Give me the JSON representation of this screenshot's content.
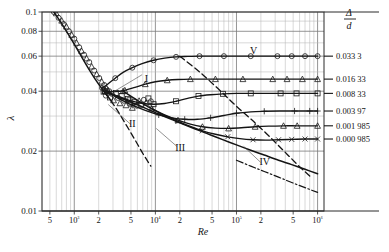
{
  "chart_data": {
    "type": "line",
    "title": "",
    "xlabel": "Re",
    "ylabel": "λ",
    "xscale": "log",
    "yscale": "log",
    "xlim": [
      400,
      1200000
    ],
    "ylim": [
      0.01,
      0.1
    ],
    "grid": true,
    "legend_position": "right",
    "legend_title_num": "Δ",
    "legend_title_den": "d",
    "x_ticks": [
      {
        "value": 500,
        "label": "5"
      },
      {
        "value": 1000,
        "label": "10³"
      },
      {
        "value": 2000,
        "label": "2"
      },
      {
        "value": 5000,
        "label": "5"
      },
      {
        "value": 10000,
        "label": "10⁴"
      },
      {
        "value": 20000,
        "label": "2"
      },
      {
        "value": 50000,
        "label": "5"
      },
      {
        "value": 100000,
        "label": "10⁵"
      },
      {
        "value": 200000,
        "label": "2"
      },
      {
        "value": 500000,
        "label": "5"
      },
      {
        "value": 1000000,
        "label": "10⁶"
      }
    ],
    "y_ticks": [
      {
        "value": 0.01,
        "label": "0.01"
      },
      {
        "value": 0.02,
        "label": "0.02"
      },
      {
        "value": 0.04,
        "label": "0.04"
      },
      {
        "value": 0.06,
        "label": "0.06"
      },
      {
        "value": 0.08,
        "label": "0.08"
      },
      {
        "value": 0.1,
        "label": "0.1"
      }
    ],
    "series": [
      {
        "name": "0.033 3",
        "legend_label": "0.033 3",
        "marker": "circle",
        "points": [
          [
            2200,
            0.0415
          ],
          [
            2600,
            0.0435
          ],
          [
            3200,
            0.0465
          ],
          [
            4000,
            0.0497
          ],
          [
            5200,
            0.0525
          ],
          [
            7000,
            0.0552
          ],
          [
            9500,
            0.0572
          ],
          [
            13000,
            0.0586
          ],
          [
            18000,
            0.0595
          ],
          [
            25000,
            0.0598
          ],
          [
            35000,
            0.06
          ],
          [
            50000,
            0.06
          ],
          [
            70000,
            0.06
          ],
          [
            100000,
            0.06
          ],
          [
            150000,
            0.06
          ],
          [
            220000,
            0.06
          ],
          [
            320000,
            0.06
          ],
          [
            480000,
            0.06
          ],
          [
            700000,
            0.06
          ],
          [
            1000000,
            0.06
          ]
        ]
      },
      {
        "name": "0.016 33",
        "legend_label": "0.016 33",
        "marker": "triangle",
        "points": [
          [
            2400,
            0.04
          ],
          [
            3200,
            0.0398
          ],
          [
            4200,
            0.0404
          ],
          [
            5600,
            0.0418
          ],
          [
            7500,
            0.0434
          ],
          [
            10000,
            0.0446
          ],
          [
            14000,
            0.0454
          ],
          [
            19000,
            0.0458
          ],
          [
            27000,
            0.046
          ],
          [
            38000,
            0.046
          ],
          [
            55000,
            0.046
          ],
          [
            80000,
            0.046
          ],
          [
            120000,
            0.046
          ],
          [
            180000,
            0.046
          ],
          [
            280000,
            0.046
          ],
          [
            420000,
            0.046
          ],
          [
            650000,
            0.046
          ],
          [
            1000000,
            0.046
          ]
        ]
      },
      {
        "name": "0.008 33",
        "legend_label": "0.008 33",
        "marker": "square",
        "points": [
          [
            2400,
            0.04
          ],
          [
            3400,
            0.0378
          ],
          [
            4800,
            0.036
          ],
          [
            6800,
            0.0348
          ],
          [
            9500,
            0.0344
          ],
          [
            13000,
            0.0347
          ],
          [
            18000,
            0.0356
          ],
          [
            25000,
            0.0368
          ],
          [
            34000,
            0.0378
          ],
          [
            48000,
            0.0384
          ],
          [
            68000,
            0.0388
          ],
          [
            100000,
            0.039
          ],
          [
            150000,
            0.039
          ],
          [
            230000,
            0.039
          ],
          [
            350000,
            0.039
          ],
          [
            550000,
            0.039
          ],
          [
            1000000,
            0.039
          ]
        ]
      },
      {
        "name": "0.003 97",
        "legend_label": "0.003 97",
        "marker": "plus",
        "points": [
          [
            2400,
            0.04
          ],
          [
            3600,
            0.0366
          ],
          [
            5200,
            0.034
          ],
          [
            7500,
            0.032
          ],
          [
            11000,
            0.0304
          ],
          [
            16000,
            0.0294
          ],
          [
            23000,
            0.0289
          ],
          [
            33000,
            0.0289
          ],
          [
            48000,
            0.0294
          ],
          [
            70000,
            0.0302
          ],
          [
            100000,
            0.031
          ],
          [
            150000,
            0.0315
          ],
          [
            220000,
            0.0317
          ],
          [
            340000,
            0.0318
          ],
          [
            520000,
            0.0318
          ],
          [
            800000,
            0.0318
          ],
          [
            1000000,
            0.0318
          ]
        ]
      },
      {
        "name": "0.001 985",
        "legend_label": "0.001 985",
        "marker": "triangle",
        "points": [
          [
            4000,
            0.04
          ],
          [
            6000,
            0.036
          ],
          [
            9000,
            0.0327
          ],
          [
            13000,
            0.0304
          ],
          [
            19000,
            0.0286
          ],
          [
            27000,
            0.0273
          ],
          [
            38000,
            0.0265
          ],
          [
            55000,
            0.0261
          ],
          [
            80000,
            0.026
          ],
          [
            115000,
            0.0262
          ],
          [
            170000,
            0.0265
          ],
          [
            250000,
            0.0267
          ],
          [
            380000,
            0.0268
          ],
          [
            560000,
            0.0268
          ],
          [
            1000000,
            0.0268
          ]
        ]
      },
      {
        "name": "0.000 985",
        "legend_label": "0.000 985",
        "marker": "cross",
        "points": [
          [
            9000,
            0.0327
          ],
          [
            13000,
            0.0302
          ],
          [
            19000,
            0.0282
          ],
          [
            27000,
            0.0266
          ],
          [
            38000,
            0.0253
          ],
          [
            55000,
            0.0243
          ],
          [
            78000,
            0.0236
          ],
          [
            110000,
            0.0231
          ],
          [
            160000,
            0.0228
          ],
          [
            230000,
            0.0227
          ],
          [
            330000,
            0.0228
          ],
          [
            480000,
            0.0229
          ],
          [
            700000,
            0.023
          ],
          [
            1000000,
            0.023
          ]
        ]
      }
    ],
    "laminar_branch": {
      "name": "laminar-line",
      "label": "I",
      "style": "solid",
      "points": [
        [
          560,
          0.1
        ],
        [
          700,
          0.0875
        ],
        [
          900,
          0.074
        ],
        [
          1150,
          0.0625
        ],
        [
          1500,
          0.052
        ],
        [
          1900,
          0.0447
        ],
        [
          2400,
          0.0392
        ],
        [
          2900,
          0.0355
        ]
      ]
    },
    "laminar_extension": {
      "name": "laminar-extension-dashed",
      "style": "dashed",
      "points": [
        [
          2400,
          0.0392
        ],
        [
          3200,
          0.0333
        ],
        [
          4200,
          0.0278
        ],
        [
          5600,
          0.0228
        ],
        [
          7200,
          0.0191
        ],
        [
          8800,
          0.0168
        ]
      ]
    },
    "smooth_pipe_curve": {
      "name": "blasius-smooth-pipe",
      "label": "IV",
      "style": "solid",
      "points": [
        [
          2400,
          0.04
        ],
        [
          3600,
          0.0372
        ],
        [
          5200,
          0.035
        ],
        [
          7600,
          0.0328
        ],
        [
          11000,
          0.0307
        ],
        [
          16000,
          0.0288
        ],
        [
          23000,
          0.0271
        ],
        [
          33000,
          0.0256
        ],
        [
          48000,
          0.0241
        ],
        [
          70000,
          0.0227
        ],
        [
          100000,
          0.0215
        ],
        [
          150000,
          0.0202
        ],
        [
          220000,
          0.0191
        ],
        [
          330000,
          0.018
        ],
        [
          480000,
          0.0171
        ],
        [
          700000,
          0.0162
        ],
        [
          1000000,
          0.0154
        ]
      ]
    },
    "prandtl_extension": {
      "name": "prandtl-karman-curve",
      "style": "dash-dot",
      "points": [
        [
          100000,
          0.018
        ],
        [
          150000,
          0.0168
        ],
        [
          220000,
          0.0158
        ],
        [
          330000,
          0.0148
        ],
        [
          480000,
          0.0139
        ],
        [
          700000,
          0.0131
        ],
        [
          1000000,
          0.0124
        ]
      ]
    },
    "transition_dashed": {
      "name": "transition-boundary-dashed",
      "style": "dashed",
      "points": [
        [
          20000,
          0.06
        ],
        [
          35000,
          0.05
        ],
        [
          60000,
          0.041
        ],
        [
          100000,
          0.0336
        ],
        [
          170000,
          0.0277
        ],
        [
          280000,
          0.0228
        ],
        [
          420000,
          0.0193
        ],
        [
          600000,
          0.0167
        ],
        [
          800000,
          0.015
        ]
      ]
    },
    "scatter_zone_I": {
      "name": "laminar-scatter-points",
      "points": [
        [
          560,
          0.1
        ],
        [
          600,
          0.0985
        ],
        [
          640,
          0.0935
        ],
        [
          700,
          0.0905
        ],
        [
          740,
          0.087
        ],
        [
          800,
          0.0845
        ],
        [
          860,
          0.08
        ],
        [
          930,
          0.0768
        ],
        [
          1000,
          0.0735
        ],
        [
          1070,
          0.07
        ],
        [
          1150,
          0.0665
        ],
        [
          1230,
          0.0638
        ],
        [
          1320,
          0.061
        ],
        [
          1420,
          0.0585
        ],
        [
          1530,
          0.056
        ],
        [
          1640,
          0.0532
        ],
        [
          1760,
          0.0508
        ],
        [
          1890,
          0.0487
        ],
        [
          2030,
          0.0466
        ],
        [
          2180,
          0.0447
        ],
        [
          2340,
          0.043
        ],
        [
          2510,
          0.0414
        ],
        [
          2700,
          0.04
        ]
      ]
    },
    "scatter_zone_II": {
      "name": "critical-zone-scatter-points",
      "points": [
        [
          2300,
          0.0398
        ],
        [
          2450,
          0.038
        ],
        [
          2600,
          0.0405
        ],
        [
          2750,
          0.0372
        ],
        [
          2900,
          0.0388
        ],
        [
          3050,
          0.036
        ],
        [
          3250,
          0.0392
        ],
        [
          3450,
          0.037
        ],
        [
          3650,
          0.0348
        ],
        [
          3850,
          0.0378
        ],
        [
          4100,
          0.0358
        ],
        [
          4350,
          0.034
        ],
        [
          4600,
          0.0366
        ],
        [
          4900,
          0.0345
        ],
        [
          5200,
          0.033
        ],
        [
          5500,
          0.0352
        ],
        [
          5900,
          0.0338
        ],
        [
          6300,
          0.0358
        ],
        [
          6700,
          0.0342
        ],
        [
          7200,
          0.0362
        ],
        [
          7700,
          0.035
        ],
        [
          8200,
          0.0368
        ],
        [
          8800,
          0.0356
        ]
      ]
    },
    "annotations": [
      {
        "label": "I",
        "x": 0.37,
        "y": 0.35,
        "name": "zone-label-I"
      },
      {
        "label": "II",
        "x": 0.32,
        "y": 0.58,
        "name": "zone-label-II"
      },
      {
        "label": "III",
        "x": 0.49,
        "y": 0.7,
        "name": "zone-label-III"
      },
      {
        "label": "IV",
        "x": 0.79,
        "y": 0.77,
        "name": "zone-label-IV"
      },
      {
        "label": "V",
        "x": 0.75,
        "y": 0.21,
        "name": "zone-label-V"
      }
    ]
  }
}
